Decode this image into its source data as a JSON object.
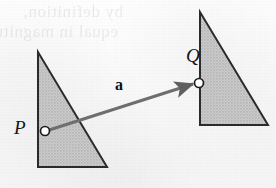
{
  "figure": {
    "kind": "geometry-diagram",
    "background_color": "#fbfbfb",
    "page_width": 276,
    "page_height": 188
  },
  "showthrough": {
    "note": "faint mirrored bleed-through text from the reverse side of the scanned page",
    "line1": "by definition,",
    "line2": "equal in magnitude",
    "color": "#000000",
    "opacity": 0.07
  },
  "shapes": {
    "fill_color": "#c9c9c9",
    "stroke_color": "#2b2b2b",
    "stroke_width": 2,
    "triangles": [
      {
        "name": "left-triangle",
        "points": "38,52 38,167 107,167",
        "vertices": [
          {
            "x": 38,
            "y": 52
          },
          {
            "x": 38,
            "y": 167
          },
          {
            "x": 107,
            "y": 167
          }
        ]
      },
      {
        "name": "right-triangle",
        "points": "200,12 200,125 268,125",
        "vertices": [
          {
            "x": 200,
            "y": 12
          },
          {
            "x": 200,
            "y": 125
          },
          {
            "x": 268,
            "y": 125
          }
        ]
      }
    ]
  },
  "vector": {
    "label": "a",
    "label_style": "bold",
    "from_point": "P",
    "to_point": "Q",
    "start": {
      "x": 46,
      "y": 131
    },
    "end": {
      "x": 196,
      "y": 83
    },
    "color": "#6e6e6e",
    "stroke_width": 3,
    "arrowhead": "filled-triangle"
  },
  "points": [
    {
      "name": "P",
      "label": "P",
      "x": 45,
      "y": 131,
      "marker": "open-circle",
      "marker_radius": 4.5,
      "marker_fill": "#ffffff",
      "marker_stroke": "#1c1c1c",
      "label_position": "left"
    },
    {
      "name": "Q",
      "label": "Q",
      "x": 199,
      "y": 83,
      "marker": "open-circle",
      "marker_radius": 4.5,
      "marker_fill": "#ffffff",
      "marker_stroke": "#1c1c1c",
      "label_position": "upper-left"
    }
  ]
}
